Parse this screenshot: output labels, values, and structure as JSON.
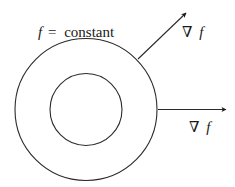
{
  "diagram": {
    "title_label": {
      "variable": "f",
      "equals": "=",
      "text": "constant"
    },
    "gradient_labels": [
      {
        "nabla": "∇",
        "variable": "f"
      },
      {
        "nabla": "∇",
        "variable": "f"
      }
    ],
    "shapes": {
      "outer_circle": {
        "cx": 86,
        "cy": 109.5,
        "r": 71
      },
      "inner_circle": {
        "cx": 86,
        "cy": 109.5,
        "r": 36
      }
    },
    "arrows": [
      {
        "name": "gradient-arrow-diagonal",
        "x1": 138,
        "y1": 59,
        "x2": 186,
        "y2": 13
      },
      {
        "name": "gradient-arrow-horizontal",
        "x1": 158,
        "y1": 109.5,
        "x2": 226,
        "y2": 109.5
      }
    ],
    "colors": {
      "stroke": "#2a2a2a",
      "background": "#ffffff"
    }
  }
}
